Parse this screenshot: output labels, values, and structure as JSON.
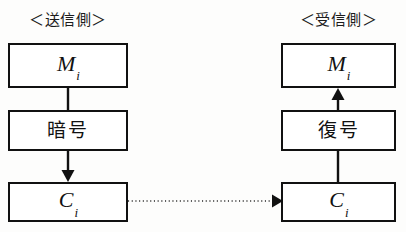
{
  "diagram": {
    "type": "flow-diagram",
    "background_color": "#fdfdfc",
    "stroke_color": "#111111",
    "columns": [
      {
        "id": "sender",
        "header": "＜送信側＞",
        "nodes": [
          {
            "id": "sender-message",
            "label": "M",
            "subscript": "i",
            "kind": "math"
          },
          {
            "id": "sender-encrypt",
            "label": "暗号",
            "kind": "cjk"
          },
          {
            "id": "sender-cipher",
            "label": "C",
            "subscript": "i",
            "kind": "math"
          }
        ]
      },
      {
        "id": "receiver",
        "header": "＜受信側＞",
        "nodes": [
          {
            "id": "receiver-message",
            "label": "M",
            "subscript": "i",
            "kind": "math"
          },
          {
            "id": "receiver-decrypt",
            "label": "復号",
            "kind": "cjk"
          },
          {
            "id": "receiver-cipher",
            "label": "C",
            "subscript": "i",
            "kind": "math"
          }
        ]
      }
    ],
    "connectors": [
      {
        "id": "sender-message-to-encrypt",
        "from": "sender-message",
        "to": "sender-encrypt",
        "style": "solid",
        "arrowhead": "none",
        "direction": "down"
      },
      {
        "id": "sender-encrypt-to-cipher",
        "from": "sender-encrypt",
        "to": "sender-cipher",
        "style": "solid",
        "arrowhead": "filled-triangle",
        "direction": "down"
      },
      {
        "id": "transmission-channel",
        "from": "sender-cipher",
        "to": "receiver-cipher",
        "style": "dotted",
        "arrowhead": "filled-triangle",
        "direction": "right"
      },
      {
        "id": "receiver-cipher-to-decrypt",
        "from": "receiver-cipher",
        "to": "receiver-decrypt",
        "style": "solid",
        "arrowhead": "none",
        "direction": "up"
      },
      {
        "id": "receiver-decrypt-to-message",
        "from": "receiver-decrypt",
        "to": "receiver-message",
        "style": "solid",
        "arrowhead": "filled-triangle",
        "direction": "up"
      }
    ]
  }
}
